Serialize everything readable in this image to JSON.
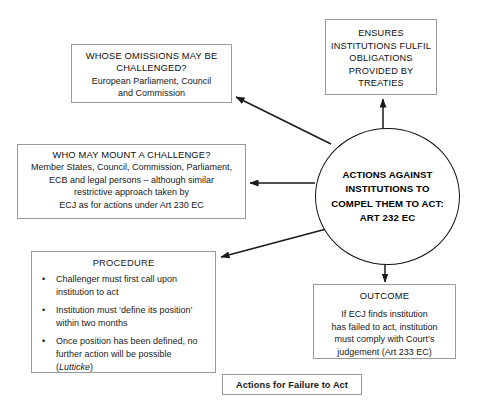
{
  "diagram": {
    "caption": "Actions for Failure to Act",
    "center": {
      "lines": [
        "ACTIONS AGAINST",
        "INSTITUTIONS TO",
        "COMPEL THEM TO ACT:",
        "ART 232 EC"
      ]
    },
    "ensures": {
      "lines": [
        "ENSURES",
        "INSTITUTIONS FULFIL",
        "OBLIGATIONS",
        "PROVIDED BY",
        "TREATIES"
      ]
    },
    "omissions": {
      "heading_line1": "WHOSE OMISSIONS MAY BE",
      "heading_line2": "CHALLENGED?",
      "body_line1": "European Parliament, Council",
      "body_line2": "and Commission"
    },
    "who_may_mount": {
      "heading": "WHO MAY MOUNT A CHALLENGE?",
      "body_line1": "Member States, Council,  Commission, Parliament,",
      "body_line2": "ECB and legal persons – although similar",
      "body_line3": "restrictive approach taken by",
      "body_line4": "ECJ as for actions under Art 230 EC"
    },
    "procedure": {
      "title": "PROCEDURE",
      "bullet_marker": "•",
      "bullets": [
        "Challenger must first call upon institution to act",
        "Institution must ‘define its position’ within two months",
        "Once position has been defined, no further action will be possible ("
      ],
      "case_name": "Lutticke",
      "bullet3_tail": ")"
    },
    "outcome": {
      "title": "OUTCOME",
      "body_line1": "If ECJ finds institution",
      "body_line2": "has failed to act, institution",
      "body_line3": "must comply with Court’s",
      "body_line4": "judgement (Art 233 EC)"
    },
    "colors": {
      "box_border": "#9a9a9a",
      "circle_border": "#111111",
      "connector": "#1a1a1a",
      "background": "#ffffff",
      "text": "#171717"
    },
    "connectors": [
      {
        "name": "center-to-ensures",
        "from": "center",
        "to": "ensures",
        "direction": "up"
      },
      {
        "name": "center-to-omissions",
        "from": "center",
        "to": "omissions",
        "direction": "up-left"
      },
      {
        "name": "center-to-who-may-mount",
        "from": "center",
        "to": "who_may_mount",
        "direction": "left"
      },
      {
        "name": "center-to-procedure",
        "from": "center",
        "to": "procedure",
        "direction": "down-left"
      },
      {
        "name": "center-to-outcome",
        "from": "center",
        "to": "outcome",
        "direction": "down"
      }
    ]
  }
}
